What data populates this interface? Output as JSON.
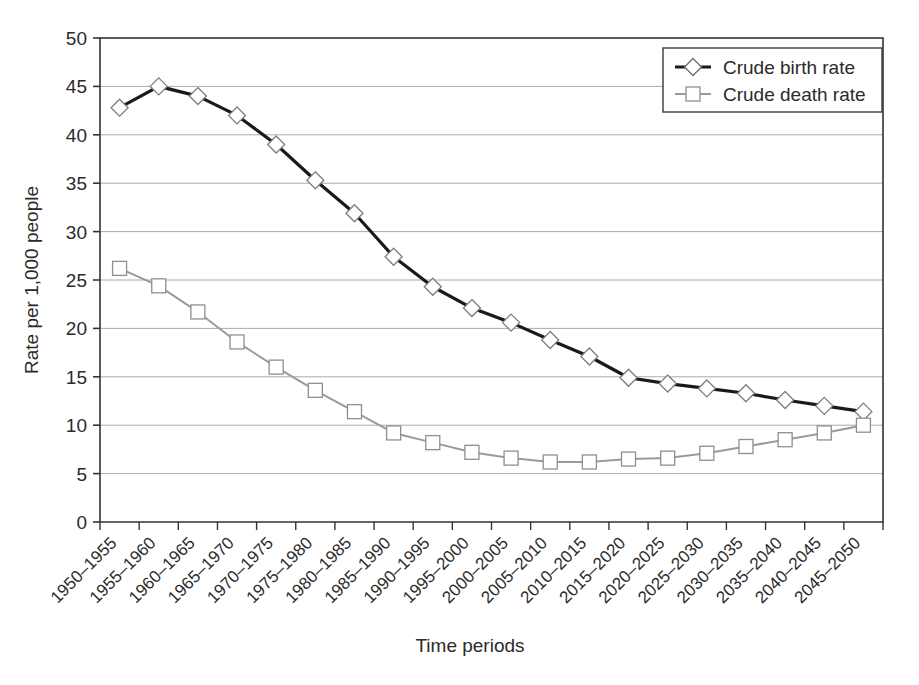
{
  "chart_data": {
    "type": "line",
    "title": "",
    "xlabel": "Time periods",
    "ylabel": "Rate per 1,000 people",
    "ylim": [
      0,
      50
    ],
    "ytick_step": 5,
    "yticks": [
      "0",
      "5",
      "10",
      "15",
      "20",
      "25",
      "30",
      "35",
      "40",
      "45",
      "50"
    ],
    "grid": "horizontal",
    "legend_position": "top-right",
    "categories": [
      "1950–1955",
      "1955–1960",
      "1960–1965",
      "1965–1970",
      "1970–1975",
      "1975–1980",
      "1980–1985",
      "1985–1990",
      "1990–1995",
      "1995–2000",
      "2000–2005",
      "2005–2010",
      "2010–2015",
      "2015–2020",
      "2020–2025",
      "2025–2030",
      "2030–2035",
      "2035–2040",
      "2040–2045",
      "2045–2050"
    ],
    "series": [
      {
        "name": "Crude birth rate",
        "marker": "diamond",
        "color": "#1a1a1a",
        "values": [
          42.8,
          45.0,
          44.0,
          42.0,
          39.0,
          35.3,
          31.9,
          27.4,
          24.3,
          22.1,
          20.6,
          18.8,
          17.1,
          14.9,
          14.3,
          13.8,
          13.3,
          12.6,
          12.0,
          11.4
        ]
      },
      {
        "name": "Crude death rate",
        "marker": "square",
        "color": "#9a9a9a",
        "values": [
          26.2,
          24.4,
          21.7,
          18.6,
          16.0,
          13.6,
          11.4,
          9.2,
          8.2,
          7.2,
          6.6,
          6.2,
          6.2,
          6.5,
          6.6,
          7.1,
          7.8,
          8.5,
          9.2,
          10.0
        ]
      }
    ]
  },
  "legend": {
    "items": [
      {
        "label": "Crude birth rate",
        "marker": "diamond",
        "color": "#1a1a1a"
      },
      {
        "label": "Crude death rate",
        "marker": "square",
        "color": "#9a9a9a"
      }
    ]
  },
  "colors": {
    "background": "#ffffff",
    "gridline": "#aaaaaa",
    "axis": "#333333",
    "birth_rate": "#1a1a1a",
    "death_rate": "#9a9a9a",
    "marker_fill": "#ffffff"
  }
}
